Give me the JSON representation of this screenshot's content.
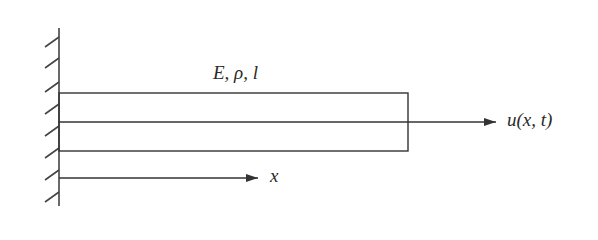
{
  "diagram": {
    "bar_properties_label": "E, ρ, l",
    "displacement_label": "u(x, t)",
    "axis_label": "x",
    "colors": {
      "stroke": "#333333",
      "text": "#2a2a2a",
      "background": "#ffffff"
    },
    "elements": [
      {
        "name": "fixed-wall",
        "type": "hatched-support"
      },
      {
        "name": "bar",
        "type": "rectangle",
        "label": "E, ρ, l"
      },
      {
        "name": "displacement-arrow",
        "type": "arrow",
        "label": "u(x, t)"
      },
      {
        "name": "x-axis-arrow",
        "type": "arrow",
        "label": "x"
      }
    ]
  }
}
